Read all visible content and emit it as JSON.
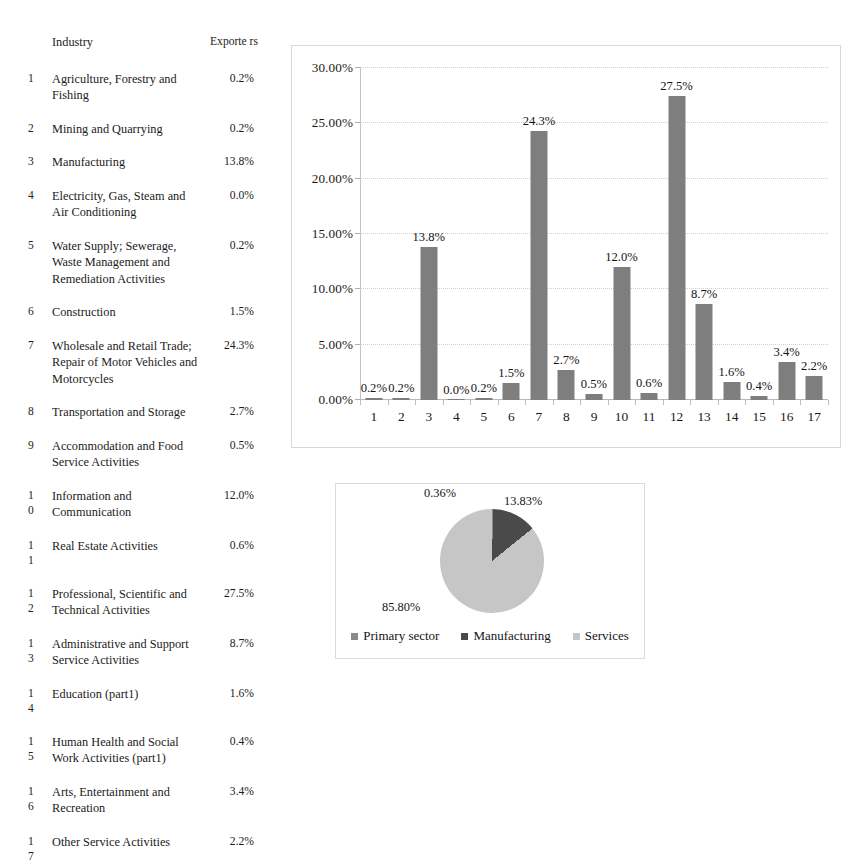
{
  "table": {
    "headers": {
      "number": "",
      "industry": "Industry",
      "exporters": "Exporte\nrs"
    },
    "rows": [
      {
        "num": "1",
        "name": "Agriculture, Forestry and Fishing",
        "value": "0.2%"
      },
      {
        "num": "2",
        "name": "Mining and Quarrying",
        "value": "0.2%"
      },
      {
        "num": "3",
        "name": "Manufacturing",
        "value": "13.8%"
      },
      {
        "num": "4",
        "name": "Electricity, Gas, Steam and Air Conditioning",
        "value": "0.0%"
      },
      {
        "num": "5",
        "name": "Water Supply; Sewerage, Waste Management and Remediation Activities",
        "value": "0.2%"
      },
      {
        "num": "6",
        "name": "Construction",
        "value": "1.5%"
      },
      {
        "num": "7",
        "name": "Wholesale and Retail Trade; Repair of Motor Vehicles and Motorcycles",
        "value": "24.3%"
      },
      {
        "num": "8",
        "name": "Transportation and Storage",
        "value": "2.7%"
      },
      {
        "num": "9",
        "name": "Accommodation and Food Service Activities",
        "value": "0.5%"
      },
      {
        "num": "1\n0",
        "name": "Information and Communication",
        "value": "12.0%"
      },
      {
        "num": "1\n1",
        "name": "Real Estate Activities",
        "value": "0.6%"
      },
      {
        "num": "1\n2",
        "name": "Professional, Scientific and Technical Activities",
        "value": "27.5%"
      },
      {
        "num": "1\n3",
        "name": "Administrative and Support Service Activities",
        "value": "8.7%"
      },
      {
        "num": "1\n4",
        "name": "Education (part1)",
        "value": "1.6%"
      },
      {
        "num": "1\n5",
        "name": "Human Health and Social Work Activities (part1)",
        "value": "0.4%"
      },
      {
        "num": "1\n6",
        "name": "Arts, Entertainment and Recreation",
        "value": "3.4%"
      },
      {
        "num": "1\n7",
        "name": "Other Service Activities",
        "value": "2.2%"
      }
    ]
  },
  "chart_data": [
    {
      "type": "bar",
      "title": "",
      "xlabel": "",
      "ylabel": "",
      "ylim": [
        0,
        30
      ],
      "ytick_labels": [
        "0.00%",
        "5.00%",
        "10.00%",
        "15.00%",
        "20.00%",
        "25.00%",
        "30.00%"
      ],
      "ytick_values": [
        0,
        5,
        10,
        15,
        20,
        25,
        30
      ],
      "grid": true,
      "legend": "none",
      "categories": [
        "1",
        "2",
        "3",
        "4",
        "5",
        "6",
        "7",
        "8",
        "9",
        "10",
        "11",
        "12",
        "13",
        "14",
        "15",
        "16",
        "17"
      ],
      "values": [
        0.2,
        0.2,
        13.8,
        0.0,
        0.2,
        1.5,
        24.3,
        2.7,
        0.5,
        12.0,
        0.6,
        27.5,
        8.7,
        1.6,
        0.4,
        3.4,
        2.2
      ],
      "data_labels": [
        "0.2%",
        "0.2%",
        "13.8%",
        "0.0%",
        "0.2%",
        "1.5%",
        "24.3%",
        "2.7%",
        "0.5%",
        "12.0%",
        "0.6%",
        "27.5%",
        "8.7%",
        "1.6%",
        "0.4%",
        "3.4%",
        "2.2%"
      ],
      "bar_color": "#7e7e7e"
    },
    {
      "type": "pie",
      "title": "",
      "legend": "bottom",
      "labels": [
        "Primary sector",
        "Manufacturing",
        "Services"
      ],
      "values": [
        0.36,
        13.83,
        85.8
      ],
      "data_labels": [
        "0.36%",
        "13.83%",
        "85.80%"
      ],
      "colors": [
        "#8a8a8a",
        "#4a4a4a",
        "#c6c6c6"
      ]
    }
  ],
  "colors": {
    "bar": "#7e7e7e",
    "pie_primary": "#8a8a8a",
    "pie_manufacturing": "#4a4a4a",
    "pie_services": "#c6c6c6",
    "frame": "#d8d8d8",
    "grid": "#cfcfcf"
  }
}
